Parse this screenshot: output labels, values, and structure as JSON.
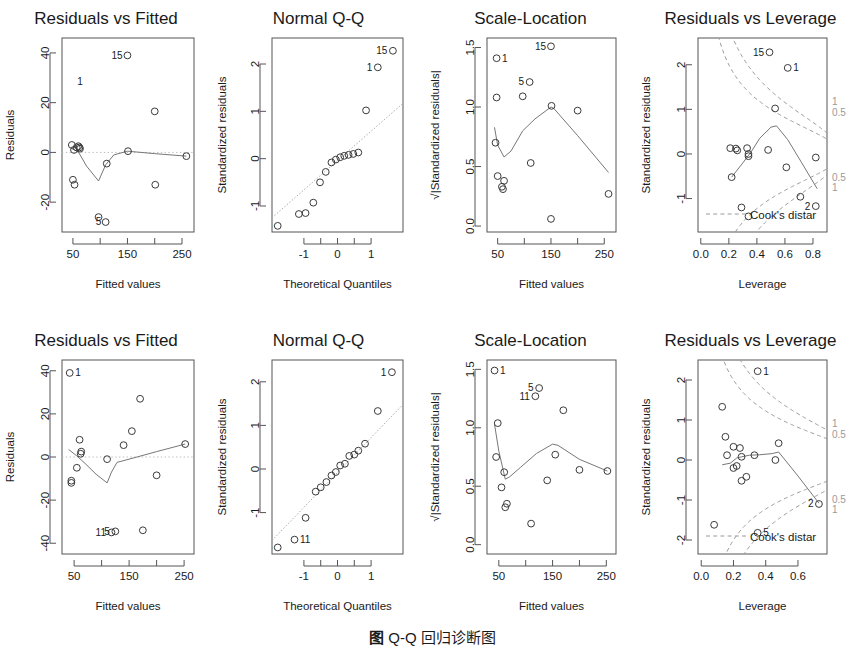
{
  "figure": {
    "caption_prefix": "图",
    "caption_label": "Q-Q",
    "caption_text": "回归诊断图",
    "rows": 2,
    "cols": 4
  },
  "colors": {
    "point_stroke": "#3a3a3a",
    "frame": "#555555",
    "lowess": "#777777",
    "qq_reference": "#a9a9a9",
    "cook_contour": "#9a9a9a",
    "cook_label": "#9a9a9a",
    "text": "#1a1a1a",
    "background": "#ffffff"
  },
  "chart_data": [
    {
      "id": "top-residuals-vs-fitted",
      "type": "scatter",
      "row": 0,
      "col": 0,
      "title": "Residuals vs Fitted",
      "xlabel": "Fitted values",
      "ylabel": "Residuals",
      "xlim": [
        30,
        272
      ],
      "ylim": [
        -32,
        46
      ],
      "xticks": [
        50,
        150,
        250
      ],
      "xticklabels": [
        "50",
        "150",
        "250"
      ],
      "yticks": [
        -20,
        0,
        20,
        40
      ],
      "yticklabels": [
        "-20",
        "0",
        "20",
        "40"
      ],
      "grid": false,
      "x": [
        48,
        52,
        57,
        60,
        62,
        63,
        50,
        53,
        97,
        110,
        112,
        150,
        151,
        200,
        201,
        258
      ],
      "y": [
        3,
        1,
        2,
        2.5,
        2,
        1.5,
        -11,
        -13,
        -26,
        -28,
        -4.5,
        39,
        0.5,
        16.5,
        -13,
        -1.5
      ],
      "point_labels": [
        {
          "label": "1",
          "x": 48,
          "y": 28.5,
          "side": "right"
        },
        {
          "label": "15",
          "x": 151,
          "y": 39,
          "side": "left"
        },
        {
          "label": "5",
          "x": 112,
          "y": -28,
          "side": "left"
        }
      ],
      "smoother": {
        "name": "lowess",
        "x": [
          48,
          60,
          75,
          97,
          110,
          125,
          150,
          200,
          258
        ],
        "y": [
          1.5,
          0.2,
          -5.5,
          -11.5,
          -5.0,
          -1.0,
          0.5,
          -0.5,
          -1.5
        ]
      },
      "reference_line": {
        "type": "horizontal-dotted",
        "y": 0
      }
    },
    {
      "id": "top-normal-qq",
      "type": "scatter",
      "row": 0,
      "col": 1,
      "title": "Normal Q-Q",
      "xlabel": "Theoretical Quantiles",
      "ylabel": "Standardized residuals",
      "xlim": [
        -1.95,
        1.95
      ],
      "ylim": [
        -1.55,
        2.55
      ],
      "xticks": [
        -1,
        0,
        1
      ],
      "xticklabels": [
        "-1",
        "0",
        "1"
      ],
      "yticks": [
        -1,
        0,
        1,
        2
      ],
      "yticklabels": [
        "-1",
        "0",
        "1",
        "2"
      ],
      "grid": false,
      "x": [
        -1.78,
        -1.15,
        -0.95,
        -0.72,
        -0.52,
        -0.35,
        -0.18,
        -0.05,
        0.08,
        0.2,
        0.33,
        0.47,
        0.62,
        0.85,
        1.2,
        1.65
      ],
      "y": [
        -1.42,
        -1.17,
        -1.15,
        -0.93,
        -0.5,
        -0.28,
        -0.08,
        -0.02,
        0.03,
        0.06,
        0.08,
        0.1,
        0.13,
        1.02,
        1.93,
        2.28
      ],
      "point_labels": [
        {
          "label": "5",
          "x": -1.78,
          "y": -1.42,
          "side": "left"
        },
        {
          "label": "1",
          "x": 1.2,
          "y": 1.93,
          "side": "left"
        },
        {
          "label": "15",
          "x": 1.65,
          "y": 2.28,
          "side": "left"
        }
      ],
      "reference_line": {
        "type": "qq-line",
        "slope": 0.62,
        "intercept": -0.04
      }
    },
    {
      "id": "top-scale-location",
      "type": "scatter",
      "row": 0,
      "col": 2,
      "title": "Scale-Location",
      "xlabel": "Fitted values",
      "ylabel": "√|Standardized residuals|",
      "xlim": [
        30,
        272
      ],
      "ylim": [
        -0.05,
        1.58
      ],
      "xticks": [
        50,
        150,
        250
      ],
      "xticklabels": [
        "50",
        "150",
        "250"
      ],
      "yticks": [
        0.0,
        0.5,
        1.0,
        1.5
      ],
      "yticklabels": [
        "0.0",
        "0.5",
        "1.0",
        "1.5"
      ],
      "grid": false,
      "x": [
        48,
        48,
        46,
        50,
        58,
        60,
        62,
        97,
        110,
        112,
        150,
        151,
        200,
        258
      ],
      "y": [
        1.41,
        1.08,
        0.7,
        0.42,
        0.33,
        0.31,
        0.38,
        1.09,
        1.21,
        0.53,
        1.51,
        1.01,
        0.97,
        0.27
      ],
      "point_labels": [
        {
          "label": "1",
          "x": 48,
          "y": 1.41,
          "side": "right"
        },
        {
          "label": "15",
          "x": 151,
          "y": 1.51,
          "side": "left"
        },
        {
          "label": "5",
          "x": 110,
          "y": 1.21,
          "side": "left"
        }
      ],
      "extra_points": [
        {
          "x": 150,
          "y": 0.06
        }
      ],
      "smoother": {
        "name": "lowess",
        "x": [
          44,
          50,
          62,
          75,
          97,
          120,
          150,
          155,
          200,
          258
        ],
        "y": [
          0.83,
          0.68,
          0.58,
          0.63,
          0.8,
          0.9,
          1.0,
          0.99,
          0.76,
          0.45
        ]
      }
    },
    {
      "id": "top-residuals-vs-leverage",
      "type": "scatter",
      "row": 0,
      "col": 3,
      "title": "Residuals vs Leverage",
      "xlabel": "Leverage",
      "ylabel": "Standardized residuals",
      "xlim": [
        -0.02,
        0.9
      ],
      "ylim": [
        -1.75,
        2.6
      ],
      "xticks": [
        0.0,
        0.2,
        0.4,
        0.6,
        0.8
      ],
      "xticklabels": [
        "0.0",
        "0.2",
        "0.4",
        "0.6",
        "0.8"
      ],
      "yticks": [
        -1,
        0,
        1,
        2
      ],
      "yticklabels": [
        "-1",
        "0",
        "1",
        "2"
      ],
      "grid": false,
      "x": [
        0.21,
        0.25,
        0.26,
        0.33,
        0.34,
        0.34,
        0.48,
        0.53,
        0.61,
        0.71,
        0.82,
        0.82,
        0.22,
        0.29,
        0.49,
        0.62
      ],
      "y": [
        0.13,
        0.12,
        0.08,
        0.13,
        0.0,
        -0.05,
        0.09,
        1.02,
        -0.3,
        -0.96,
        -1.17,
        -0.08,
        -0.52,
        -1.2,
        2.28,
        1.93
      ],
      "point_labels": [
        {
          "label": "15",
          "x": 0.49,
          "y": 2.28,
          "side": "left"
        },
        {
          "label": "1",
          "x": 0.62,
          "y": 1.93,
          "side": "right"
        },
        {
          "label": "2",
          "x": 0.82,
          "y": -1.17,
          "side": "left"
        }
      ],
      "extra_points": [
        {
          "x": 0.34,
          "y": -1.4
        }
      ],
      "smoother": {
        "name": "lowess",
        "x": [
          0.22,
          0.3,
          0.36,
          0.42,
          0.5,
          0.54,
          0.62,
          0.72,
          0.83
        ],
        "y": [
          -0.52,
          -0.2,
          0.05,
          0.35,
          0.6,
          0.63,
          0.32,
          -0.2,
          -0.78
        ]
      },
      "cook_contours": [
        {
          "level": "1",
          "position": "upper-right",
          "label": "1"
        },
        {
          "level": "0.5",
          "position": "upper-right",
          "label": "0.5"
        },
        {
          "level": "0.5",
          "position": "lower-right",
          "label": "0.5"
        },
        {
          "level": "1",
          "position": "lower-right",
          "label": "1"
        }
      ],
      "legend_text": "Cook's distar",
      "legend_full": "Cook's distance"
    },
    {
      "id": "bottom-residuals-vs-fitted",
      "type": "scatter",
      "row": 1,
      "col": 0,
      "title": "Residuals vs Fitted",
      "xlabel": "Fitted values",
      "ylabel": "Residuals",
      "xlim": [
        28,
        268
      ],
      "ylim": [
        -45,
        45
      ],
      "xticks": [
        50,
        150,
        250
      ],
      "xticklabels": [
        "50",
        "150",
        "250"
      ],
      "yticks": [
        -40,
        -20,
        0,
        20,
        40
      ],
      "yticklabels": [
        "-40",
        "-20",
        "0",
        "20",
        "40"
      ],
      "grid": false,
      "x": [
        42,
        45,
        45,
        55,
        60,
        62,
        63,
        110,
        118,
        125,
        140,
        155,
        170,
        175,
        200,
        252
      ],
      "y": [
        39,
        -11,
        -12,
        -5,
        8,
        1.5,
        2.5,
        -1,
        -35,
        -34.5,
        5.5,
        12,
        27,
        -34,
        -8.5,
        6
      ],
      "point_labels": [
        {
          "label": "1",
          "x": 42,
          "y": 39,
          "side": "right"
        },
        {
          "label": "11",
          "x": 118,
          "y": -35,
          "side": "left"
        },
        {
          "label": "5",
          "x": 125,
          "y": -34.5,
          "side": "left"
        }
      ],
      "smoother": {
        "name": "lowess",
        "x": [
          40,
          55,
          70,
          90,
          110,
          118,
          128,
          150,
          200,
          252
        ],
        "y": [
          3.5,
          0.5,
          -3.0,
          -8.0,
          -12.0,
          -7.0,
          -2.5,
          -1.0,
          2.5,
          6.0
        ]
      },
      "reference_line": {
        "type": "horizontal-dotted",
        "y": 0
      }
    },
    {
      "id": "bottom-normal-qq",
      "type": "scatter",
      "row": 1,
      "col": 1,
      "title": "Normal Q-Q",
      "xlabel": "Theoretical Quantiles",
      "ylabel": "Standardized residuals",
      "xlim": [
        -1.95,
        1.95
      ],
      "ylim": [
        -1.95,
        2.5
      ],
      "xticks": [
        -1,
        0,
        1
      ],
      "xticklabels": [
        "-1",
        "0",
        "1"
      ],
      "yticks": [
        -1,
        0,
        1,
        2
      ],
      "yticklabels": [
        "-1",
        "0",
        "1",
        "2"
      ],
      "grid": false,
      "x": [
        -1.78,
        -1.28,
        -0.95,
        -0.65,
        -0.5,
        -0.33,
        -0.18,
        -0.05,
        0.08,
        0.22,
        0.35,
        0.5,
        0.62,
        0.82,
        1.2,
        1.62
      ],
      "y": [
        -1.8,
        -1.62,
        -1.12,
        -0.52,
        -0.42,
        -0.3,
        -0.15,
        -0.07,
        0.08,
        0.12,
        0.3,
        0.33,
        0.42,
        0.58,
        1.33,
        2.22
      ],
      "point_labels": [
        {
          "label": "5",
          "x": -1.78,
          "y": -1.8,
          "side": "left"
        },
        {
          "label": "11",
          "x": -1.28,
          "y": -1.62,
          "side": "right"
        },
        {
          "label": "1",
          "x": 1.62,
          "y": 2.22,
          "side": "left"
        }
      ],
      "reference_line": {
        "type": "qq-line",
        "slope": 0.8,
        "intercept": -0.08
      }
    },
    {
      "id": "bottom-scale-location",
      "type": "scatter",
      "row": 1,
      "col": 2,
      "title": "Scale-Location",
      "xlabel": "Fitted values",
      "ylabel": "√|Standardized residuals|",
      "xlim": [
        28,
        268
      ],
      "ylim": [
        -0.08,
        1.58
      ],
      "xticks": [
        50,
        150,
        250
      ],
      "xticklabels": [
        "50",
        "150",
        "250"
      ],
      "yticks": [
        0.0,
        0.5,
        1.0,
        1.5
      ],
      "yticklabels": [
        "0.0",
        "0.5",
        "1.0",
        "1.5"
      ],
      "grid": false,
      "x": [
        42,
        48,
        45,
        55,
        60,
        62,
        65,
        110,
        118,
        125,
        140,
        155,
        170,
        200,
        252
      ],
      "y": [
        1.49,
        1.04,
        0.75,
        0.49,
        0.62,
        0.32,
        0.35,
        0.18,
        1.27,
        1.34,
        0.55,
        0.77,
        1.15,
        0.64,
        0.63
      ],
      "point_labels": [
        {
          "label": "1",
          "x": 42,
          "y": 1.49,
          "side": "right"
        },
        {
          "label": "5",
          "x": 125,
          "y": 1.34,
          "side": "left"
        },
        {
          "label": "11",
          "x": 118,
          "y": 1.27,
          "side": "left"
        }
      ],
      "smoother": {
        "name": "lowess",
        "x": [
          42,
          50,
          62,
          70,
          90,
          120,
          150,
          160,
          200,
          252
        ],
        "y": [
          1.03,
          0.8,
          0.56,
          0.58,
          0.66,
          0.78,
          0.86,
          0.85,
          0.73,
          0.63
        ]
      }
    },
    {
      "id": "bottom-residuals-vs-leverage",
      "type": "scatter",
      "row": 1,
      "col": 3,
      "title": "Residuals vs Leverage",
      "xlabel": "Leverage",
      "ylabel": "Standardized residuals",
      "xlim": [
        -0.02,
        0.78
      ],
      "ylim": [
        -2.35,
        2.5
      ],
      "xticks": [
        0.0,
        0.2,
        0.4,
        0.6
      ],
      "xticklabels": [
        "0.0",
        "0.2",
        "0.4",
        "0.6"
      ],
      "yticks": [
        -2,
        -1,
        0,
        1,
        2
      ],
      "yticklabels": [
        "-2",
        "-1",
        "0",
        "1",
        "2"
      ],
      "grid": false,
      "x": [
        0.13,
        0.15,
        0.16,
        0.2,
        0.22,
        0.24,
        0.25,
        0.25,
        0.28,
        0.33,
        0.46,
        0.48,
        0.73,
        0.08,
        0.2,
        0.35
      ],
      "y": [
        1.33,
        0.58,
        0.12,
        0.33,
        -0.15,
        0.3,
        0.08,
        -0.52,
        -0.42,
        0.12,
        0.0,
        0.42,
        -1.1,
        -1.62,
        -0.2,
        -1.82
      ],
      "point_labels": [
        {
          "label": "1",
          "x": 0.35,
          "y": 2.22,
          "side": "right"
        },
        {
          "label": "2",
          "x": 0.73,
          "y": -1.1,
          "side": "left"
        },
        {
          "label": "5",
          "x": 0.35,
          "y": -1.82,
          "side": "right"
        }
      ],
      "extra_points": [
        {
          "x": 0.35,
          "y": 2.22
        }
      ],
      "smoother": {
        "name": "lowess",
        "x": [
          0.13,
          0.18,
          0.22,
          0.25,
          0.3,
          0.36,
          0.44,
          0.48,
          0.6,
          0.73
        ],
        "y": [
          -0.12,
          -0.08,
          0.05,
          0.08,
          0.12,
          0.13,
          0.16,
          0.2,
          -0.4,
          -1.08
        ]
      },
      "cook_contours": [
        {
          "level": "1",
          "position": "upper-right",
          "label": "1"
        },
        {
          "level": "0.5",
          "position": "upper-right",
          "label": "0.5"
        },
        {
          "level": "0.5",
          "position": "lower-right",
          "label": "0.5"
        },
        {
          "level": "1",
          "position": "lower-right",
          "label": "1"
        }
      ],
      "legend_text": "Cook's distar",
      "legend_full": "Cook's distance"
    }
  ]
}
